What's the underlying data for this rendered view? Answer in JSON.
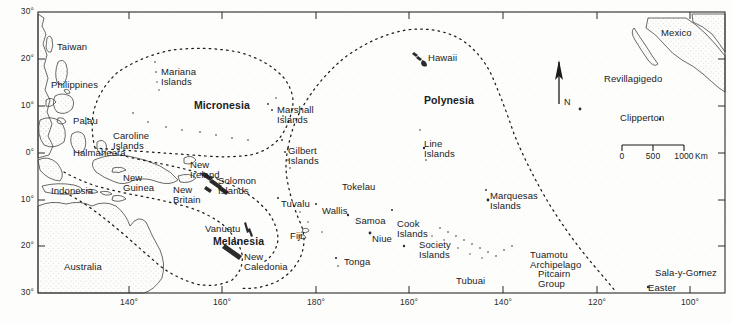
{
  "map": {
    "title": "Pacific Ocean Island Regions Map",
    "frame": {
      "left": 38,
      "top": 12,
      "right": 725,
      "bottom": 293
    },
    "projection_note": "equirectangular, 140E to 100W, 30N to 30S",
    "background_color": "#fdfdfc",
    "ink_color": "#1b1b1b",
    "coastline_color": "#3a3a3a",
    "boundary_style": "dotted"
  },
  "axes": {
    "latitude": {
      "unit": "degrees",
      "ticks": [
        {
          "label": "30°",
          "value": 30,
          "hemisphere": "N",
          "y": 12
        },
        {
          "label": "20°",
          "value": 20,
          "hemisphere": "N",
          "y": 59
        },
        {
          "label": "10°",
          "value": 10,
          "hemisphere": "N",
          "y": 106
        },
        {
          "label": "0°",
          "value": 0,
          "hemisphere": "",
          "y": 153
        },
        {
          "label": "10°",
          "value": 10,
          "hemisphere": "S",
          "y": 200
        },
        {
          "label": "20°",
          "value": 20,
          "hemisphere": "S",
          "y": 246
        },
        {
          "label": "30°",
          "value": 30,
          "hemisphere": "S",
          "y": 293
        }
      ]
    },
    "longitude": {
      "unit": "degrees",
      "ticks": [
        {
          "label": "140°",
          "value": 140,
          "hemisphere": "E",
          "x": 129
        },
        {
          "label": "160°",
          "value": 160,
          "hemisphere": "E",
          "x": 222
        },
        {
          "label": "180°",
          "value": 180,
          "hemisphere": "",
          "x": 316
        },
        {
          "label": "160°",
          "value": 160,
          "hemisphere": "W",
          "x": 409
        },
        {
          "label": "140°",
          "value": 140,
          "hemisphere": "W",
          "x": 503
        },
        {
          "label": "120°",
          "value": 120,
          "hemisphere": "W",
          "x": 597
        },
        {
          "label": "100°",
          "value": 100,
          "hemisphere": "W",
          "x": 690
        }
      ]
    }
  },
  "regions": [
    {
      "name": "Micronesia",
      "label": "Micronesia",
      "x": 194,
      "y": 100
    },
    {
      "name": "Polynesia",
      "label": "Polynesia",
      "x": 424,
      "y": 95
    },
    {
      "name": "Melanesia",
      "label": "Melanesia",
      "x": 213,
      "y": 236
    }
  ],
  "places": [
    {
      "name": "taiwan",
      "label": "Taiwan",
      "x": 57,
      "y": 42,
      "align": "left"
    },
    {
      "name": "philippines",
      "label": "Philippines",
      "x": 51,
      "y": 80,
      "align": "left"
    },
    {
      "name": "palau",
      "label": "Palau",
      "x": 73,
      "y": 116,
      "align": "left"
    },
    {
      "name": "halmaheera",
      "label": "Halmaheera",
      "x": 73,
      "y": 148,
      "align": "left"
    },
    {
      "name": "caroline-islands",
      "label": "Caroline\nIslands",
      "x": 113,
      "y": 131,
      "align": "left"
    },
    {
      "name": "mariana-islands",
      "label": "Mariana\nIslands",
      "x": 161,
      "y": 67,
      "align": "left"
    },
    {
      "name": "marshall-islands",
      "label": "Marshall\nIslands",
      "x": 277,
      "y": 105,
      "align": "left"
    },
    {
      "name": "gilbert-islands",
      "label": "Gilbert\nIslands",
      "x": 288,
      "y": 146,
      "align": "left"
    },
    {
      "name": "indonesia",
      "label": "Indonesia",
      "x": 51,
      "y": 186,
      "align": "left"
    },
    {
      "name": "new-guinea",
      "label": "New\nGuinea",
      "x": 123,
      "y": 173,
      "align": "left"
    },
    {
      "name": "new-ireland",
      "label": "New\nIreland",
      "x": 190,
      "y": 160,
      "align": "left"
    },
    {
      "name": "new-britain",
      "label": "New\nBritain",
      "x": 173,
      "y": 185,
      "align": "left"
    },
    {
      "name": "solomon-islands",
      "label": "Solomon\nIslands",
      "x": 218,
      "y": 176,
      "align": "left"
    },
    {
      "name": "australia",
      "label": "Australia",
      "x": 64,
      "y": 262,
      "align": "left"
    },
    {
      "name": "vanuatu",
      "label": "Vanuatu",
      "x": 205,
      "y": 224,
      "align": "left"
    },
    {
      "name": "new-caledonia",
      "label": "New\nCaledonia",
      "x": 244,
      "y": 252,
      "align": "left"
    },
    {
      "name": "fiji",
      "label": "Fiji",
      "x": 290,
      "y": 231,
      "align": "left"
    },
    {
      "name": "tuvalu",
      "label": "Tuvalu",
      "x": 281,
      "y": 199,
      "align": "left"
    },
    {
      "name": "wallis",
      "label": "Wallis",
      "x": 322,
      "y": 206,
      "align": "left"
    },
    {
      "name": "tokelau",
      "label": "Tokelau",
      "x": 342,
      "y": 182,
      "align": "left"
    },
    {
      "name": "samoa",
      "label": "Samoa",
      "x": 355,
      "y": 216,
      "align": "left"
    },
    {
      "name": "tonga",
      "label": "Tonga",
      "x": 344,
      "y": 257,
      "align": "left"
    },
    {
      "name": "niue",
      "label": "Niue",
      "x": 372,
      "y": 234,
      "align": "left"
    },
    {
      "name": "cook-islands",
      "label": "Cook\nIslands",
      "x": 397,
      "y": 219,
      "align": "left"
    },
    {
      "name": "society-islands",
      "label": "Society\nIslands",
      "x": 419,
      "y": 240,
      "align": "left"
    },
    {
      "name": "line-islands",
      "label": "Line\nIslands",
      "x": 424,
      "y": 139,
      "align": "left"
    },
    {
      "name": "hawaii",
      "label": "Hawaii",
      "x": 428,
      "y": 53,
      "align": "left"
    },
    {
      "name": "marquesas-islands",
      "label": "Marquesas\nIslands",
      "x": 490,
      "y": 191,
      "align": "left"
    },
    {
      "name": "tuamotu-archipelago",
      "label": "Tuamotu\nArchipelago",
      "x": 530,
      "y": 250,
      "align": "left"
    },
    {
      "name": "pitcairn-group",
      "label": "Pitcairn\nGroup",
      "x": 538,
      "y": 269,
      "align": "left"
    },
    {
      "name": "tubuai",
      "label": "Tubuai",
      "x": 456,
      "y": 276,
      "align": "left"
    },
    {
      "name": "easter",
      "label": "Easter",
      "x": 648,
      "y": 283,
      "align": "left"
    },
    {
      "name": "sala-y-gomez",
      "label": "Sala-y-Gomez",
      "x": 655,
      "y": 268,
      "align": "left"
    },
    {
      "name": "clipperton",
      "label": "Clipperton",
      "x": 620,
      "y": 113,
      "align": "left"
    },
    {
      "name": "revillagigedo",
      "label": "Revillagigedo",
      "x": 604,
      "y": 74,
      "align": "left"
    },
    {
      "name": "mexico",
      "label": "Mexico",
      "x": 661,
      "y": 28,
      "align": "left"
    }
  ],
  "compass": {
    "name": "north-arrow",
    "label": "N",
    "x": 559,
    "y": 62,
    "height": 44
  },
  "scale_bar": {
    "name": "scale-bar",
    "unit_label": "Km",
    "ticks": [
      "0",
      "500",
      "1000"
    ],
    "x": 622,
    "y": 145,
    "width": 62
  }
}
